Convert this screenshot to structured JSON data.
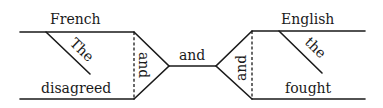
{
  "diagram": {
    "type": "sentence-diagram",
    "sentence": "The French and the English disagreed and fought",
    "left_clause": {
      "subject": "French",
      "subject_modifier": "The",
      "predicate": "disagreed",
      "coordinator": "and"
    },
    "center_conjunction": "and",
    "right_clause": {
      "subject": "English",
      "subject_modifier": "the",
      "predicate": "fought",
      "coordinator": "and"
    }
  }
}
